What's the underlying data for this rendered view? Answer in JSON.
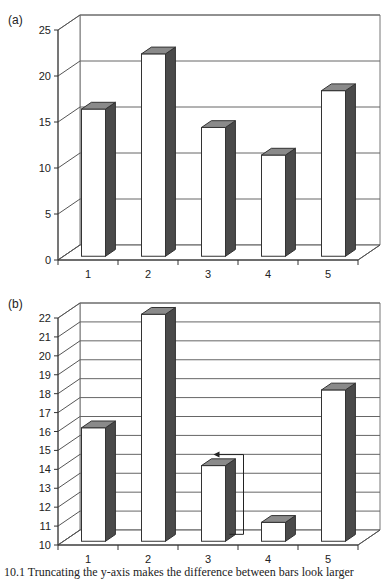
{
  "chart_data": [
    {
      "panel": "(a)",
      "type": "bar",
      "style": "3d",
      "categories": [
        "1",
        "2",
        "3",
        "4",
        "5"
      ],
      "values": [
        16,
        22,
        14,
        11,
        18
      ],
      "yticks": [
        0,
        5,
        10,
        15,
        20,
        25
      ],
      "ylim": [
        0,
        25
      ],
      "grid": true,
      "title": "",
      "xlabel": "",
      "ylabel": ""
    },
    {
      "panel": "(b)",
      "type": "bar",
      "style": "3d",
      "categories": [
        "1",
        "2",
        "3",
        "4",
        "5"
      ],
      "values": [
        16,
        22,
        14,
        11,
        18
      ],
      "yticks": [
        10,
        11,
        12,
        13,
        14,
        15,
        16,
        17,
        18,
        19,
        20,
        21,
        22
      ],
      "ylim": [
        10,
        22
      ],
      "grid": true,
      "annotation": "bracket arrow from bar 4 up to bar 3 top",
      "title": "",
      "xlabel": "",
      "ylabel": ""
    }
  ],
  "labels": {
    "a": "(a)",
    "b": "(b)"
  },
  "caption": "10.1 Truncating the y-axis makes the difference between bars look larger"
}
